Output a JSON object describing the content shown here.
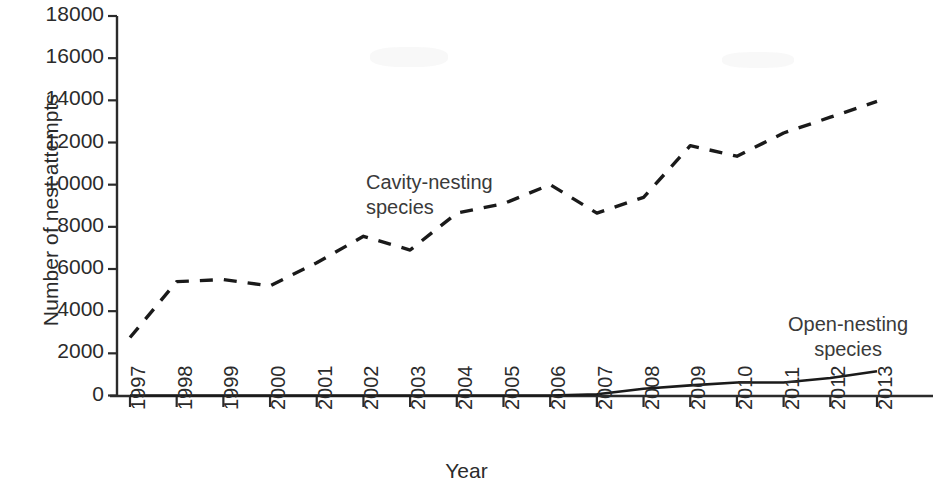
{
  "chart_data": {
    "type": "line",
    "title": "",
    "xlabel": "Year",
    "ylabel": "Number of nest attempts",
    "categories": [
      1997,
      1998,
      1999,
      2000,
      2001,
      2002,
      2003,
      2004,
      2005,
      2006,
      2007,
      2008,
      2009,
      2010,
      2011,
      2012,
      2013
    ],
    "xtick_labels": [
      "1997",
      "1998",
      "1999",
      "2000",
      "2001",
      "2002",
      "2003",
      "2004",
      "2005",
      "2006",
      "2007",
      "2008",
      "2009",
      "2010",
      "2011",
      "2012",
      "2013"
    ],
    "ytick_labels": [
      "0",
      "2000",
      "4000",
      "6000",
      "8000",
      "10000",
      "12000",
      "14000",
      "16000",
      "18000"
    ],
    "ytick_values": [
      0,
      2000,
      4000,
      6000,
      8000,
      10000,
      12000,
      14000,
      16000,
      18000
    ],
    "ylim": [
      0,
      18000
    ],
    "xlim": [
      1997,
      2013
    ],
    "grid": false,
    "legend_position": "inline-annotation",
    "series": [
      {
        "name": "Cavity-nesting species",
        "style": "dashed",
        "color": "#1a1a1a",
        "values": [
          2750,
          5400,
          5500,
          5200,
          6300,
          7550,
          6900,
          8650,
          9100,
          10000,
          8650,
          9400,
          11850,
          11350,
          12450,
          13200,
          13950
        ]
      },
      {
        "name": "Open-nesting species",
        "style": "solid",
        "color": "#1a1a1a",
        "values": [
          0,
          0,
          0,
          0,
          0,
          0,
          0,
          0,
          0,
          0,
          60,
          320,
          480,
          620,
          620,
          830,
          1150
        ]
      }
    ],
    "annotations": [
      {
        "id": "cavity",
        "text_lines": [
          "Cavity-nesting",
          "species"
        ]
      },
      {
        "id": "open",
        "text_lines": [
          "Open-nesting",
          "species"
        ]
      }
    ]
  },
  "axis": {
    "y_title": "Number of nest attempts",
    "x_title": "Year"
  },
  "labels": {
    "cavity_line1": "Cavity-nesting",
    "cavity_line2": "species",
    "open_line1": "Open-nesting",
    "open_line2": "species"
  }
}
